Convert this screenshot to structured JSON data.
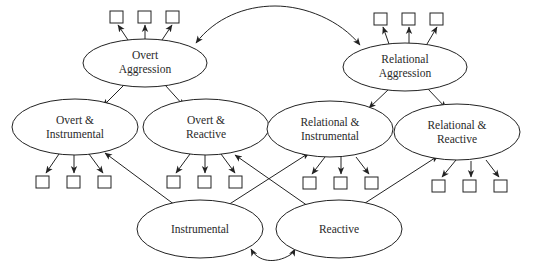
{
  "diagram": {
    "type": "structural-equation-model",
    "colors": {
      "stroke": "#222222",
      "text": "#2a2a2a",
      "background": "#ffffff"
    },
    "nodes": {
      "overt_aggression": {
        "line1": "Overt",
        "line2": "Aggression"
      },
      "relational_aggression": {
        "line1": "Relational",
        "line2": "Aggression"
      },
      "overt_instrumental": {
        "line1": "Overt &",
        "line2": "Instrumental"
      },
      "overt_reactive": {
        "line1": "Overt &",
        "line2": "Reactive"
      },
      "relational_instrumental": {
        "line1": "Relational &",
        "line2": "Instrumental"
      },
      "relational_reactive": {
        "line1": "Relational &",
        "line2": "Reactive"
      },
      "instrumental": {
        "label": "Instrumental"
      },
      "reactive": {
        "label": "Reactive"
      }
    },
    "indicator_boxes_per_factor": 3,
    "edges": [
      {
        "from": "Overt Aggression",
        "to": "Relational Aggression",
        "type": "bidirectional-curve"
      },
      {
        "from": "Instrumental",
        "to": "Reactive",
        "type": "bidirectional-curve"
      },
      {
        "from": "Overt Aggression",
        "to": "Overt & Instrumental",
        "type": "directed"
      },
      {
        "from": "Overt Aggression",
        "to": "Overt & Reactive",
        "type": "directed"
      },
      {
        "from": "Relational Aggression",
        "to": "Relational & Instrumental",
        "type": "directed"
      },
      {
        "from": "Relational Aggression",
        "to": "Relational & Reactive",
        "type": "directed"
      },
      {
        "from": "Instrumental",
        "to": "Overt & Instrumental",
        "type": "directed"
      },
      {
        "from": "Instrumental",
        "to": "Relational & Instrumental",
        "type": "directed"
      },
      {
        "from": "Reactive",
        "to": "Overt & Reactive",
        "type": "directed"
      },
      {
        "from": "Reactive",
        "to": "Relational & Reactive",
        "type": "directed"
      }
    ]
  }
}
